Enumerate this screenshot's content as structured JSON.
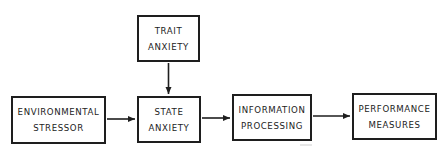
{
  "diagram": {
    "type": "flowchart",
    "colors": {
      "stroke": "#1e1e1e",
      "text": "#1c1c1c",
      "background": "#ffffff"
    },
    "nodes": [
      {
        "id": "environmental_stressor",
        "lines": [
          "ENVIRONMENTAL",
          "STRESSOR"
        ]
      },
      {
        "id": "trait_anxiety",
        "lines": [
          "TRAIT",
          "ANXIETY"
        ]
      },
      {
        "id": "state_anxiety",
        "lines": [
          "STATE",
          "ANXIETY"
        ]
      },
      {
        "id": "information_processing",
        "lines": [
          "INFORMATION",
          "PROCESSING"
        ]
      },
      {
        "id": "performance_measures",
        "lines": [
          "PERFORMANCE",
          "MEASURES"
        ]
      }
    ],
    "edges": [
      {
        "from": "environmental_stressor",
        "to": "state_anxiety",
        "direction": "right"
      },
      {
        "from": "trait_anxiety",
        "to": "state_anxiety",
        "direction": "down"
      },
      {
        "from": "state_anxiety",
        "to": "information_processing",
        "direction": "right"
      },
      {
        "from": "information_processing",
        "to": "performance_measures",
        "direction": "right"
      }
    ]
  }
}
